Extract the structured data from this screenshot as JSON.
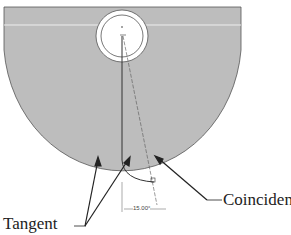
{
  "diagram": {
    "labels": {
      "tangent": "Tangent",
      "coincident": "Coincident",
      "dimension": "15.00°"
    },
    "colors": {
      "fill": "#bdbdbd",
      "stroke": "#333333",
      "background": "#ffffff"
    }
  }
}
